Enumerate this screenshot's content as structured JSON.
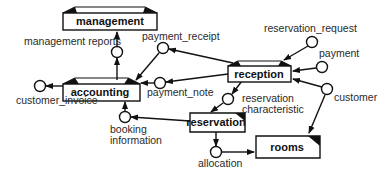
{
  "diagram": {
    "type": "data-flow",
    "stores": [
      {
        "id": "management",
        "label": "management",
        "x": 63,
        "y": 10,
        "w": 94,
        "h": 20,
        "style": "top-corners"
      },
      {
        "id": "accounting",
        "label": "accounting",
        "x": 63,
        "y": 80,
        "w": 77,
        "h": 20,
        "style": "top-corners"
      },
      {
        "id": "reception",
        "label": "reception",
        "x": 228,
        "y": 62,
        "w": 62,
        "h": 19,
        "style": "top-corners"
      },
      {
        "id": "reservation",
        "label": "reservation",
        "x": 190,
        "y": 113,
        "w": 55,
        "h": 19,
        "style": "dog-ear"
      },
      {
        "id": "rooms",
        "label": "rooms",
        "x": 256,
        "y": 135,
        "w": 64,
        "h": 23,
        "style": "dog-ear"
      }
    ],
    "flows": [
      {
        "id": "management_reports",
        "label": "management reports",
        "cx": 117,
        "cy": 52,
        "lx": 24,
        "ly": 45
      },
      {
        "id": "payment_receipt",
        "label": "payment_receipt",
        "cx": 163,
        "cy": 48,
        "lx": 142,
        "ly": 40
      },
      {
        "id": "payment_note",
        "label": "payment_note",
        "cx": 160,
        "cy": 83,
        "lx": 147,
        "ly": 96
      },
      {
        "id": "customer_invoice",
        "label": "customer_invoice",
        "cx": 40,
        "cy": 86,
        "lx": 16,
        "ly": 104
      },
      {
        "id": "reservation_request",
        "label": "reservation_request",
        "cx": 312,
        "cy": 42,
        "lx": 264,
        "ly": 32
      },
      {
        "id": "payment",
        "label": "payment",
        "cx": 322,
        "cy": 67,
        "lx": 319,
        "ly": 57
      },
      {
        "id": "customer",
        "label": "customer",
        "cx": 327,
        "cy": 89,
        "lx": 334,
        "ly": 101
      },
      {
        "id": "reservation_characteristic",
        "label": [
          "reservation",
          "characteristic"
        ],
        "cx": 228,
        "cy": 99,
        "lx": 242,
        "ly": 102
      },
      {
        "id": "booking_information",
        "label": [
          "booking",
          "information"
        ],
        "cx": 125,
        "cy": 117,
        "lx": 110,
        "ly": 133
      },
      {
        "id": "allocation",
        "label": "allocation",
        "cx": 216,
        "cy": 152,
        "lx": 198,
        "ly": 167
      }
    ]
  }
}
